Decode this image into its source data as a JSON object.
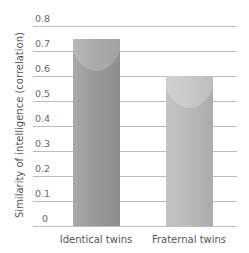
{
  "chart_data": {
    "type": "bar",
    "title": "",
    "categories": [
      "Identical twins",
      "Fraternal twins"
    ],
    "values": [
      0.75,
      0.6
    ],
    "xlabel": "",
    "ylabel": "Similarity of intelligence (correlation)",
    "ylim": [
      0,
      0.8
    ],
    "yticks": [
      "0",
      "0.1",
      "0.2",
      "0.3",
      "0.4",
      "0.5",
      "0.6",
      "0.7",
      "0.8"
    ],
    "grid": true,
    "legend": null
  },
  "colors": {
    "bar_identical": "#9a9a9a",
    "bar_fraternal": "#bababa",
    "grid": "#bdbdbd"
  }
}
